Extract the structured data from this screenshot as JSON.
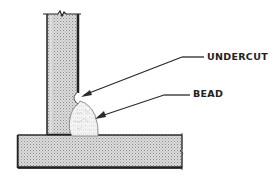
{
  "diagram": {
    "type": "weld-joint-illustration",
    "labels": {
      "undercut": "UNDERCUT",
      "bead": "BEAD"
    },
    "colors": {
      "outline": "#222222",
      "plate_fill": "#d2d2d2",
      "plate_dots": "#8a8a8a",
      "bead_fill": "#f2f2f2",
      "leader": "#2a2a2a",
      "background": "#ffffff"
    },
    "parts": [
      {
        "name": "vertical-plate",
        "label": ""
      },
      {
        "name": "horizontal-base-plate",
        "label": ""
      },
      {
        "name": "weld-bead",
        "label": "BEAD"
      },
      {
        "name": "undercut-notch",
        "label": "UNDERCUT"
      }
    ]
  }
}
